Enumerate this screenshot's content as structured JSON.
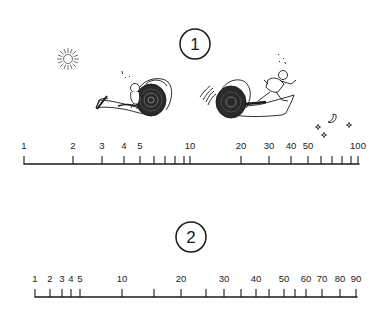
{
  "figure": {
    "background": "#ffffff",
    "ink": "#1a1a1a"
  },
  "scale1": {
    "badge": "1",
    "badge_center": [
      195,
      44
    ],
    "axis": {
      "x_start": 24,
      "x_end": 359,
      "y": 164
    },
    "ticks": [
      {
        "value": 1,
        "x": 24,
        "label": "1"
      },
      {
        "value": 2,
        "x": 73,
        "label": "2"
      },
      {
        "value": 3,
        "x": 102,
        "label": "3"
      },
      {
        "value": 4,
        "x": 124,
        "label": "4"
      },
      {
        "value": 5,
        "x": 140,
        "label": "5"
      },
      {
        "value": 6,
        "x": 154,
        "label": ""
      },
      {
        "value": 7,
        "x": 165,
        "label": ""
      },
      {
        "value": 8,
        "x": 175,
        "label": ""
      },
      {
        "value": 9,
        "x": 184,
        "label": ""
      },
      {
        "value": 10,
        "x": 190,
        "label": "10"
      },
      {
        "value": 20,
        "x": 241,
        "label": "20"
      },
      {
        "value": 30,
        "x": 269,
        "label": "30"
      },
      {
        "value": 40,
        "x": 291,
        "label": "40"
      },
      {
        "value": 50,
        "x": 308,
        "label": "50"
      },
      {
        "value": 60,
        "x": 321,
        "label": ""
      },
      {
        "value": 70,
        "x": 332,
        "label": ""
      },
      {
        "value": 80,
        "x": 342,
        "label": ""
      },
      {
        "value": 90,
        "x": 351,
        "label": ""
      },
      {
        "value": 100,
        "x": 358,
        "label": "100"
      }
    ],
    "type": "logarithmic"
  },
  "scale2": {
    "badge": "2",
    "badge_center": [
      191,
      237
    ],
    "axis": {
      "x_start": 35,
      "x_end": 357,
      "y": 297
    },
    "ticks": [
      {
        "value": 1,
        "x": 35,
        "label": "1"
      },
      {
        "value": 2,
        "x": 50,
        "label": "2"
      },
      {
        "value": 3,
        "x": 62,
        "label": "3"
      },
      {
        "value": 4,
        "x": 71,
        "label": "4"
      },
      {
        "value": 5,
        "x": 80,
        "label": "5"
      },
      {
        "value": 10,
        "x": 122,
        "label": "10"
      },
      {
        "value": 15,
        "x": 154,
        "label": ""
      },
      {
        "value": 20,
        "x": 181,
        "label": "20"
      },
      {
        "value": 25,
        "x": 206,
        "label": ""
      },
      {
        "value": 30,
        "x": 224,
        "label": "30"
      },
      {
        "value": 35,
        "x": 241,
        "label": ""
      },
      {
        "value": 40,
        "x": 256,
        "label": "40"
      },
      {
        "value": 45,
        "x": 269,
        "label": ""
      },
      {
        "value": 50,
        "x": 284,
        "label": "50"
      },
      {
        "value": 55,
        "x": 295,
        "label": ""
      },
      {
        "value": 60,
        "x": 306,
        "label": "60"
      },
      {
        "value": 70,
        "x": 322,
        "label": "70"
      },
      {
        "value": 80,
        "x": 340,
        "label": "80"
      },
      {
        "value": 90,
        "x": 356,
        "label": "90"
      }
    ],
    "type": "compressed-nonlinear"
  },
  "illustrations": {
    "sun": "sun-icon",
    "moon_and_stars": "moon-stars-icon",
    "left_scene": "child-pushing-carpet-roll",
    "right_scene": "man-running-behind-rolling-carpet"
  }
}
